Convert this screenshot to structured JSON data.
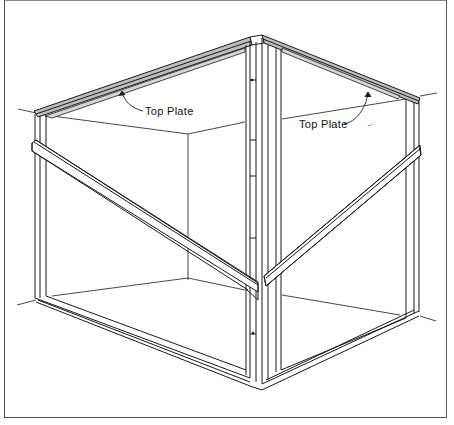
{
  "figure": {
    "type": "isometric framing illustration",
    "labels": [
      {
        "id": "top-plate-left",
        "text": "Top Plate",
        "x": 145,
        "y": 114
      },
      {
        "id": "top-plate-right",
        "text": "Top Plate",
        "x": 300,
        "y": 128
      }
    ],
    "stray_mark": "-·",
    "colors": {
      "line": "#1a1a1a",
      "plate_fill": "#bdbdbd",
      "background": "#ffffff",
      "frame": "#555555"
    }
  }
}
